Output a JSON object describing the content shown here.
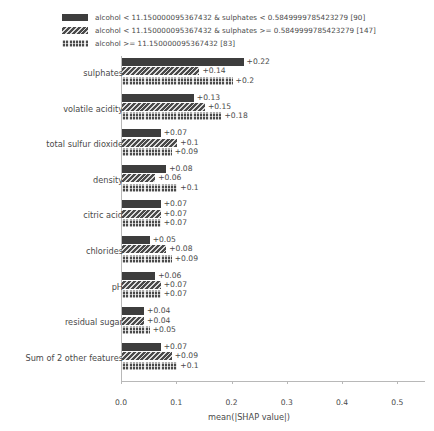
{
  "chart_data": {
    "type": "bar",
    "orientation": "horizontal",
    "title": "",
    "subtitle": "",
    "xlabel": "mean(|SHAP value|)",
    "ylabel": "",
    "xlim": [
      0.0,
      0.55
    ],
    "xticks": [
      0.0,
      0.1,
      0.2,
      0.3,
      0.4,
      0.5
    ],
    "xticklabels": [
      "0.0",
      "0.1",
      "0.2",
      "0.3",
      "0.4",
      "0.5"
    ],
    "grid": false,
    "legend_position": "top-left",
    "categories": [
      "sulphates",
      "volatile acidity",
      "total sulfur dioxide",
      "density",
      "citric acid",
      "chlorides",
      "pH",
      "residual sugar",
      "Sum of 2 other features"
    ],
    "series": [
      {
        "name": "alcohol < 11.150000095367432 & sulphates < 0.5849999785423279 [90]",
        "pattern": "solid",
        "color": "#3d3d3d",
        "values": [
          0.22,
          0.13,
          0.07,
          0.08,
          0.07,
          0.05,
          0.06,
          0.04,
          0.07
        ],
        "labels": [
          "+0.22",
          "+0.13",
          "+0.07",
          "+0.08",
          "+0.07",
          "+0.05",
          "+0.06",
          "+0.04",
          "+0.07"
        ]
      },
      {
        "name": "alcohol < 11.150000095367432 & sulphates >= 0.5849999785423279 [147]",
        "pattern": "diagonal-hatch",
        "color": "#4a4a4a",
        "values": [
          0.14,
          0.15,
          0.1,
          0.06,
          0.07,
          0.08,
          0.07,
          0.04,
          0.09
        ],
        "labels": [
          "+0.14",
          "+0.15",
          "+0.1",
          "+0.06",
          "+0.07",
          "+0.08",
          "+0.07",
          "+0.04",
          "+0.09"
        ]
      },
      {
        "name": "alcohol >= 11.150000095367432 [83]",
        "pattern": "cross-hatch-dots",
        "color": "#4a4a4a",
        "values": [
          0.2,
          0.18,
          0.09,
          0.1,
          0.07,
          0.09,
          0.07,
          0.05,
          0.1
        ],
        "labels": [
          "+0.2",
          "+0.18",
          "+0.09",
          "+0.1",
          "+0.07",
          "+0.09",
          "+0.07",
          "+0.05",
          "+0.1"
        ]
      }
    ]
  },
  "legend": {
    "items": [
      {
        "label": "alcohol < 11.150000095367432 & sulphates < 0.5849999785423279 [90]",
        "pattern": "solid"
      },
      {
        "label": "alcohol < 11.150000095367432 & sulphates >= 0.5849999785423279 [147]",
        "pattern": "diagonal-hatch"
      },
      {
        "label": "alcohol >= 11.150000095367432 [83]",
        "pattern": "cross-hatch-dots"
      }
    ]
  },
  "axis": {
    "x_label": "mean(|SHAP value|)",
    "tick_labels": [
      "0.0",
      "0.1",
      "0.2",
      "0.3",
      "0.4",
      "0.5"
    ]
  },
  "colors": {
    "series_1": "#3d3d3d",
    "series_2": "#4a4a4a",
    "series_3": "#4a4a4a",
    "axis": "#b8b8b8",
    "text": "#4a4a4a",
    "background": "#ffffff"
  }
}
